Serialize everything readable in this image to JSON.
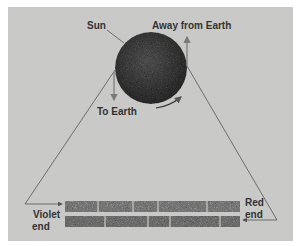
{
  "labels": {
    "sun": "Sun",
    "away": "Away from Earth",
    "to_earth": "To Earth",
    "violet_1": "Violet",
    "violet_2": "end",
    "red_1": "Red",
    "red_2": "end"
  },
  "colors": {
    "background": "#c9c9c7",
    "sun": "#3a3a3a",
    "lines": "#444444",
    "arrows": "#777777"
  }
}
